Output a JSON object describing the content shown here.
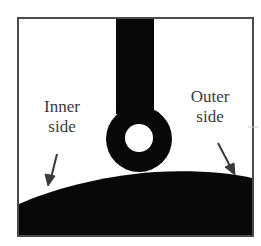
{
  "figure": {
    "labels": {
      "inner": [
        "Inner",
        "side"
      ],
      "outer": [
        "Outer",
        "side"
      ]
    },
    "colors": {
      "background": "#ffffff",
      "frame": "#4a4a4a",
      "substrate": "#080808",
      "droplet": "#080808",
      "arrow": "#3a3a3a",
      "text": "#3a3a3a"
    }
  }
}
